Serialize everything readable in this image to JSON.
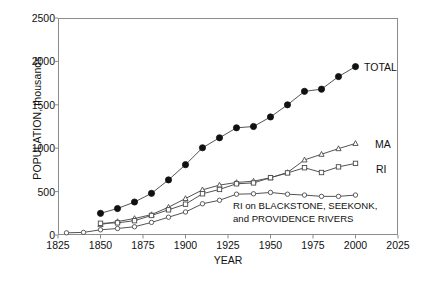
{
  "chart_data": {
    "type": "line",
    "title": "",
    "xlabel": "YEAR",
    "ylabel": "POPULATION, thousands",
    "xlim": [
      1825,
      2025
    ],
    "ylim": [
      0,
      2500
    ],
    "xticks": [
      1825,
      1850,
      1875,
      1900,
      1925,
      1950,
      1975,
      2000,
      2025
    ],
    "yticks": [
      0,
      500,
      1000,
      1500,
      2000,
      2500
    ],
    "grid": false,
    "legend_position": "at-line-ends",
    "annotations": [
      {
        "text_lines": [
          "RI on BLACKSTONE, SEEKONK,",
          "and PROVIDENCE RIVERS"
        ],
        "refers_to": "RI on BLACKSTONE, SEEKONK, and PROVIDENCE RIVERS"
      }
    ],
    "series": [
      {
        "name": "TOTAL",
        "label": "TOTAL",
        "marker": "filled-circle",
        "x": [
          1850,
          1860,
          1870,
          1880,
          1890,
          1900,
          1910,
          1920,
          1930,
          1940,
          1950,
          1960,
          1970,
          1980,
          1990,
          2000
        ],
        "values": [
          250,
          305,
          380,
          480,
          635,
          810,
          1005,
          1120,
          1235,
          1250,
          1360,
          1500,
          1655,
          1680,
          1825,
          1940
        ]
      },
      {
        "name": "MA",
        "label": "MA",
        "marker": "open-triangle",
        "x": [
          1850,
          1860,
          1870,
          1880,
          1890,
          1900,
          1910,
          1920,
          1930,
          1940,
          1950,
          1960,
          1970,
          1980,
          1990,
          2000
        ],
        "values": [
          120,
          155,
          190,
          235,
          320,
          420,
          520,
          575,
          605,
          620,
          660,
          720,
          865,
          930,
          995,
          1055
        ]
      },
      {
        "name": "RI",
        "label": "RI",
        "marker": "open-square",
        "x": [
          1850,
          1860,
          1870,
          1880,
          1890,
          1900,
          1910,
          1920,
          1930,
          1940,
          1950,
          1960,
          1970,
          1980,
          1990,
          2000
        ],
        "values": [
          135,
          140,
          165,
          225,
          290,
          355,
          475,
          525,
          590,
          600,
          660,
          715,
          775,
          720,
          785,
          825
        ]
      },
      {
        "name": "RI on BLACKSTONE, SEEKONK, and PROVIDENCE RIVERS",
        "label": "",
        "marker": "small-open-circle",
        "x": [
          1830,
          1840,
          1850,
          1860,
          1870,
          1880,
          1890,
          1900,
          1910,
          1920,
          1930,
          1940,
          1950,
          1960,
          1970,
          1980,
          1990,
          2000
        ],
        "values": [
          25,
          30,
          60,
          75,
          95,
          145,
          205,
          265,
          360,
          400,
          470,
          475,
          490,
          470,
          460,
          445,
          445,
          460
        ]
      }
    ]
  },
  "labels": {
    "series_total": "TOTAL",
    "series_ma": "MA",
    "series_ri": "RI",
    "annotation_line1": "RI on BLACKSTONE, SEEKONK,",
    "annotation_line2": "and PROVIDENCE RIVERS",
    "axis_x_title": "YEAR",
    "axis_y_title": "POPULATION, thousands"
  },
  "colors": {
    "axis": "#8c8c8c",
    "line": "#4a4a4a",
    "marker_fill": "#111111",
    "marker_open": "#ffffff",
    "text": "#111111"
  }
}
